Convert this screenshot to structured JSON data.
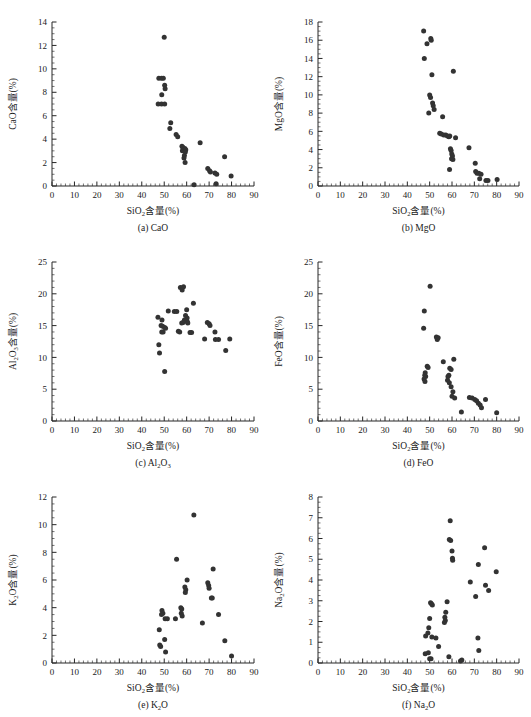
{
  "figure": {
    "x_axis_label": "SiO₂含量(%)",
    "x_axis_label_main": "SiO",
    "x_axis_label_sub": "2",
    "x_axis_label_tail": "含量(%)",
    "marker_color": "#333333",
    "axis_color": "#262626"
  },
  "chart_data": [
    {
      "type": "scatter",
      "panel": "a",
      "caption": "(a) CaO",
      "title": "",
      "xlabel": "SiO₂含量(%)",
      "ylabel": "CaO含量(%)",
      "ylabel_main": "CaO",
      "ylabel_tail": "含量(%)",
      "xlim": [
        0,
        90
      ],
      "ylim": [
        0,
        14
      ],
      "xticks": [
        0,
        10,
        20,
        30,
        40,
        50,
        60,
        70,
        80,
        90
      ],
      "yticks": [
        0,
        2,
        4,
        6,
        8,
        10,
        12,
        14
      ],
      "x_minor_step": 2,
      "y_minor_step": 0.5,
      "grid": false,
      "legend": "none",
      "points": [
        [
          50.0,
          12.7
        ],
        [
          47.6,
          9.2
        ],
        [
          48.8,
          9.2
        ],
        [
          49.6,
          9.2
        ],
        [
          50.2,
          8.6
        ],
        [
          50.4,
          8.3
        ],
        [
          48.9,
          7.8
        ],
        [
          47.3,
          7.0
        ],
        [
          48.8,
          7.0
        ],
        [
          50.2,
          7.0
        ],
        [
          52.9,
          5.4
        ],
        [
          52.5,
          4.9
        ],
        [
          55.3,
          4.4
        ],
        [
          56.0,
          4.2
        ],
        [
          57.9,
          3.4
        ],
        [
          58.3,
          3.3
        ],
        [
          58.5,
          3.2
        ],
        [
          58.1,
          3.0
        ],
        [
          59.2,
          3.2
        ],
        [
          59.6,
          3.1
        ],
        [
          59.4,
          2.9
        ],
        [
          59.0,
          2.6
        ],
        [
          58.8,
          2.4
        ],
        [
          59.3,
          2.0
        ],
        [
          66.0,
          3.7
        ],
        [
          76.9,
          2.5
        ],
        [
          69.4,
          1.5
        ],
        [
          70.2,
          1.3
        ],
        [
          70.6,
          1.2
        ],
        [
          72.6,
          1.1
        ],
        [
          73.4,
          1.0
        ],
        [
          79.8,
          0.85
        ],
        [
          63.3,
          0.1
        ],
        [
          73.1,
          0.2
        ]
      ]
    },
    {
      "type": "scatter",
      "panel": "b",
      "caption": "(b) MgO",
      "title": "",
      "xlabel": "SiO₂含量(%)",
      "ylabel": "MgO含量(%)",
      "ylabel_main": "MgO",
      "ylabel_tail": "含量(%)",
      "xlim": [
        0,
        90
      ],
      "ylim": [
        0,
        18
      ],
      "xticks": [
        0,
        10,
        20,
        30,
        40,
        50,
        60,
        70,
        80,
        90
      ],
      "yticks": [
        0,
        2,
        4,
        6,
        8,
        10,
        12,
        14,
        16,
        18
      ],
      "x_minor_step": 2,
      "y_minor_step": 0.5,
      "grid": false,
      "legend": "none",
      "points": [
        [
          47.3,
          17.0
        ],
        [
          50.5,
          16.2
        ],
        [
          50.7,
          16.0
        ],
        [
          48.8,
          15.6
        ],
        [
          47.6,
          14.0
        ],
        [
          51.0,
          12.2
        ],
        [
          60.6,
          12.6
        ],
        [
          50.0,
          10.0
        ],
        [
          50.4,
          9.7
        ],
        [
          51.3,
          9.1
        ],
        [
          51.6,
          8.8
        ],
        [
          52.0,
          8.4
        ],
        [
          49.6,
          8.0
        ],
        [
          55.8,
          7.6
        ],
        [
          54.5,
          5.8
        ],
        [
          55.2,
          5.7
        ],
        [
          56.3,
          5.6
        ],
        [
          57.2,
          5.6
        ],
        [
          58.0,
          5.5
        ],
        [
          58.6,
          5.4
        ],
        [
          59.0,
          5.5
        ],
        [
          61.6,
          5.3
        ],
        [
          67.6,
          4.2
        ],
        [
          59.3,
          4.1
        ],
        [
          59.6,
          3.9
        ],
        [
          59.9,
          3.5
        ],
        [
          60.2,
          3.3
        ],
        [
          59.8,
          3.0
        ],
        [
          60.4,
          2.9
        ],
        [
          70.4,
          2.5
        ],
        [
          58.9,
          1.8
        ],
        [
          70.6,
          1.6
        ],
        [
          71.2,
          1.4
        ],
        [
          72.0,
          1.4
        ],
        [
          73.0,
          1.3
        ],
        [
          72.4,
          0.8
        ],
        [
          75.2,
          0.6
        ],
        [
          76.1,
          0.6
        ],
        [
          80.2,
          0.7
        ]
      ]
    },
    {
      "type": "scatter",
      "panel": "c",
      "caption": "(c) Al₂O₃",
      "caption_prefix": "(c) Al",
      "caption_sub1": "2",
      "caption_mid": "O",
      "caption_sub2": "3",
      "title": "",
      "xlabel": "SiO₂含量(%)",
      "ylabel": "Al₂O₃含量(%)",
      "ylabel_main": "Al",
      "ylabel_sub1": "2",
      "ylabel_mid": "O",
      "ylabel_sub2": "3",
      "ylabel_tail": "含量(%)",
      "xlim": [
        0,
        90
      ],
      "ylim": [
        0,
        25
      ],
      "xticks": [
        0,
        10,
        20,
        30,
        40,
        50,
        60,
        70,
        80,
        90
      ],
      "yticks": [
        0,
        5,
        10,
        15,
        20,
        25
      ],
      "x_minor_step": 2,
      "y_minor_step": 1,
      "grid": false,
      "legend": "none",
      "points": [
        [
          57.2,
          21.0
        ],
        [
          58.6,
          21.1
        ],
        [
          58.0,
          20.6
        ],
        [
          63.0,
          18.5
        ],
        [
          60.0,
          17.5
        ],
        [
          51.8,
          17.3
        ],
        [
          54.5,
          17.2
        ],
        [
          55.6,
          17.2
        ],
        [
          59.5,
          16.6
        ],
        [
          60.2,
          16.2
        ],
        [
          47.2,
          16.3
        ],
        [
          49.0,
          15.9
        ],
        [
          59.0,
          15.9
        ],
        [
          60.3,
          15.6
        ],
        [
          60.5,
          15.4
        ],
        [
          48.6,
          15.0
        ],
        [
          49.3,
          14.9
        ],
        [
          50.2,
          14.7
        ],
        [
          50.6,
          14.6
        ],
        [
          57.8,
          15.4
        ],
        [
          58.4,
          15.5
        ],
        [
          48.9,
          14.0
        ],
        [
          49.5,
          14.0
        ],
        [
          56.3,
          14.1
        ],
        [
          56.9,
          14.0
        ],
        [
          61.5,
          13.9
        ],
        [
          62.2,
          13.9
        ],
        [
          69.2,
          15.5
        ],
        [
          70.0,
          15.3
        ],
        [
          70.4,
          15.0
        ],
        [
          72.6,
          14.0
        ],
        [
          68.0,
          12.9
        ],
        [
          72.8,
          12.8
        ],
        [
          74.2,
          12.8
        ],
        [
          79.2,
          12.9
        ],
        [
          77.4,
          11.1
        ],
        [
          47.6,
          12.0
        ],
        [
          47.9,
          10.7
        ],
        [
          50.2,
          7.8
        ]
      ]
    },
    {
      "type": "scatter",
      "panel": "d",
      "caption": "(d) FeO",
      "title": "",
      "xlabel": "SiO₂含量(%)",
      "ylabel": "FeO含量(%)",
      "ylabel_main": "FeO",
      "ylabel_tail": "含量(%)",
      "xlim": [
        0,
        90
      ],
      "ylim": [
        0,
        25
      ],
      "xticks": [
        0,
        10,
        20,
        30,
        40,
        50,
        60,
        70,
        80,
        90
      ],
      "yticks": [
        0,
        5,
        10,
        15,
        20,
        25
      ],
      "x_minor_step": 2,
      "y_minor_step": 1,
      "grid": false,
      "legend": "none",
      "points": [
        [
          50.2,
          21.2
        ],
        [
          47.6,
          17.3
        ],
        [
          47.3,
          14.6
        ],
        [
          53.0,
          13.2
        ],
        [
          53.8,
          13.1
        ],
        [
          53.4,
          12.8
        ],
        [
          56.1,
          9.3
        ],
        [
          60.8,
          9.7
        ],
        [
          48.9,
          8.6
        ],
        [
          49.3,
          8.4
        ],
        [
          59.0,
          8.3
        ],
        [
          59.6,
          8.1
        ],
        [
          48.0,
          7.6
        ],
        [
          47.8,
          7.2
        ],
        [
          48.2,
          7.0
        ],
        [
          58.6,
          7.2
        ],
        [
          58.2,
          7.0
        ],
        [
          47.5,
          6.6
        ],
        [
          47.9,
          6.2
        ],
        [
          58.0,
          6.4
        ],
        [
          58.8,
          6.0
        ],
        [
          59.6,
          5.4
        ],
        [
          60.4,
          4.6
        ],
        [
          60.0,
          3.9
        ],
        [
          61.2,
          3.6
        ],
        [
          67.8,
          3.7
        ],
        [
          69.0,
          3.6
        ],
        [
          70.2,
          3.4
        ],
        [
          71.0,
          3.2
        ],
        [
          71.8,
          2.8
        ],
        [
          72.6,
          2.5
        ],
        [
          75.0,
          3.4
        ],
        [
          73.2,
          2.1
        ],
        [
          64.2,
          1.4
        ],
        [
          80.0,
          1.3
        ]
      ]
    },
    {
      "type": "scatter",
      "panel": "e",
      "caption": "(e) K₂O",
      "caption_prefix": "(e) K",
      "caption_sub1": "2",
      "caption_mid": "O",
      "title": "",
      "xlabel": "SiO₂含量(%)",
      "ylabel": "K₂O含量(%)",
      "ylabel_main": "K",
      "ylabel_sub1": "2",
      "ylabel_mid": "O",
      "ylabel_tail": "含量(%)",
      "xlim": [
        0,
        90
      ],
      "ylim": [
        0,
        12
      ],
      "xticks": [
        0,
        10,
        20,
        30,
        40,
        50,
        60,
        70,
        80,
        90
      ],
      "yticks": [
        0,
        2,
        4,
        6,
        8,
        10,
        12
      ],
      "x_minor_step": 2,
      "y_minor_step": 0.5,
      "grid": false,
      "legend": "none",
      "points": [
        [
          63.2,
          10.7
        ],
        [
          55.5,
          7.5
        ],
        [
          71.8,
          6.8
        ],
        [
          60.2,
          6.0
        ],
        [
          69.4,
          5.8
        ],
        [
          69.8,
          5.6
        ],
        [
          70.0,
          5.4
        ],
        [
          59.2,
          5.5
        ],
        [
          59.6,
          5.3
        ],
        [
          59.4,
          5.1
        ],
        [
          71.0,
          4.7
        ],
        [
          71.4,
          4.7
        ],
        [
          49.0,
          3.8
        ],
        [
          49.4,
          3.6
        ],
        [
          48.8,
          3.5
        ],
        [
          57.4,
          4.0
        ],
        [
          57.8,
          3.9
        ],
        [
          57.6,
          3.6
        ],
        [
          58.0,
          3.4
        ],
        [
          50.4,
          3.2
        ],
        [
          51.4,
          3.2
        ],
        [
          55.0,
          3.2
        ],
        [
          74.2,
          3.5
        ],
        [
          67.0,
          2.9
        ],
        [
          47.8,
          2.4
        ],
        [
          50.2,
          1.7
        ],
        [
          48.0,
          1.3
        ],
        [
          48.4,
          1.2
        ],
        [
          77.0,
          1.6
        ],
        [
          50.6,
          0.8
        ],
        [
          80.0,
          0.5
        ]
      ]
    },
    {
      "type": "scatter",
      "panel": "f",
      "caption": "(f) Na₂O",
      "caption_prefix": "(f) Na",
      "caption_sub1": "2",
      "caption_mid": "O",
      "title": "",
      "xlabel": "SiO₂含量(%)",
      "ylabel": "Na₂O含量(%)",
      "ylabel_main": "Na",
      "ylabel_sub1": "2",
      "ylabel_mid": "O",
      "ylabel_tail": "含量(%)",
      "xlim": [
        0,
        90
      ],
      "ylim": [
        0,
        8
      ],
      "xticks": [
        0,
        10,
        20,
        30,
        40,
        50,
        60,
        70,
        80,
        90
      ],
      "yticks": [
        0,
        1,
        2,
        3,
        4,
        5,
        6,
        7,
        8
      ],
      "x_minor_step": 2,
      "y_minor_step": 0.25,
      "grid": false,
      "legend": "none",
      "points": [
        [
          59.2,
          6.85
        ],
        [
          58.8,
          5.95
        ],
        [
          59.4,
          5.9
        ],
        [
          74.6,
          5.55
        ],
        [
          60.0,
          5.4
        ],
        [
          60.2,
          5.05
        ],
        [
          60.3,
          4.95
        ],
        [
          71.8,
          4.75
        ],
        [
          79.8,
          4.4
        ],
        [
          68.2,
          3.9
        ],
        [
          75.0,
          3.75
        ],
        [
          76.4,
          3.5
        ],
        [
          70.6,
          3.2
        ],
        [
          57.8,
          2.95
        ],
        [
          50.4,
          2.9
        ],
        [
          50.8,
          2.85
        ],
        [
          51.2,
          2.8
        ],
        [
          57.2,
          2.45
        ],
        [
          50.0,
          2.15
        ],
        [
          56.8,
          2.2
        ],
        [
          57.0,
          2.05
        ],
        [
          56.6,
          1.95
        ],
        [
          49.6,
          1.7
        ],
        [
          49.2,
          1.45
        ],
        [
          48.2,
          1.3
        ],
        [
          51.0,
          1.25
        ],
        [
          52.8,
          1.2
        ],
        [
          71.6,
          1.2
        ],
        [
          54.0,
          0.8
        ],
        [
          72.0,
          0.6
        ],
        [
          48.0,
          0.45
        ],
        [
          49.4,
          0.5
        ],
        [
          58.6,
          0.3
        ],
        [
          50.0,
          0.2
        ],
        [
          50.6,
          0.2
        ],
        [
          63.8,
          0.1
        ],
        [
          64.4,
          0.15
        ]
      ]
    }
  ]
}
